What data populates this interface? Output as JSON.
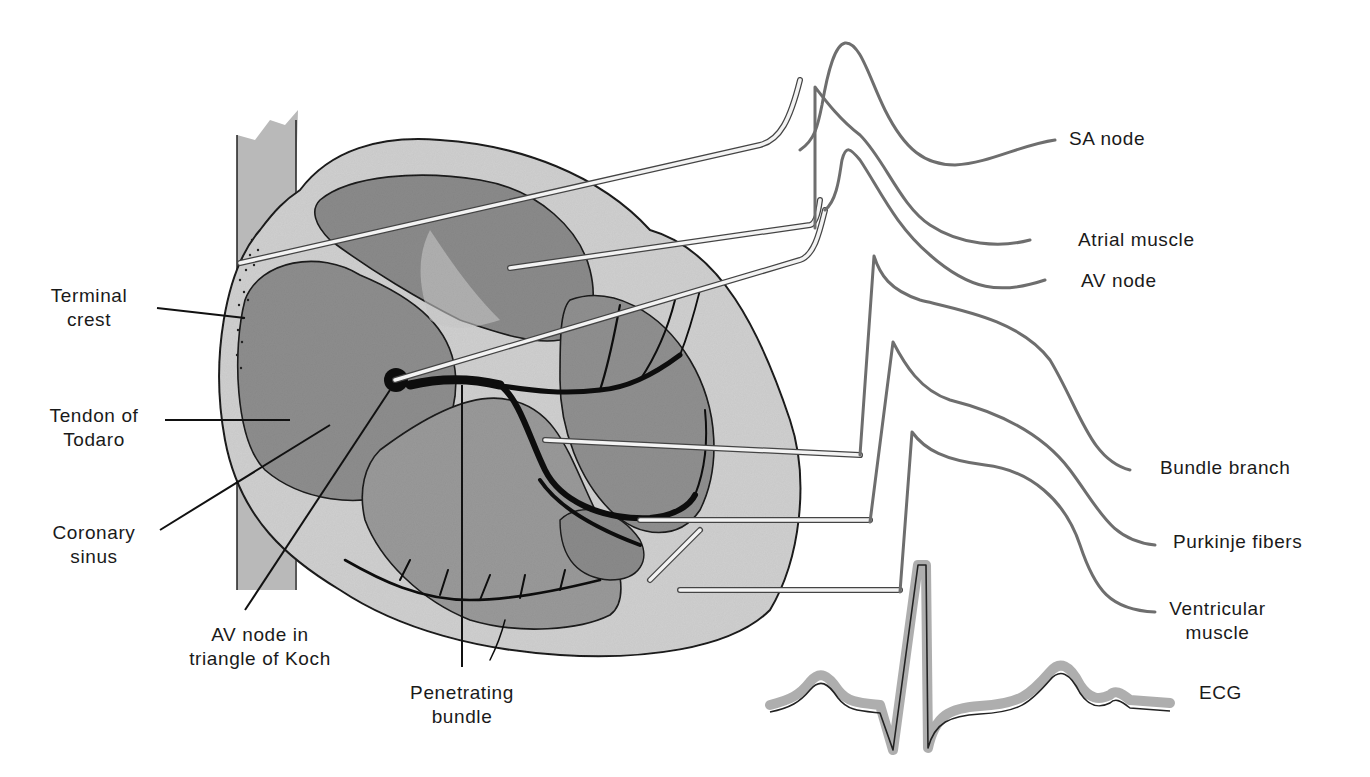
{
  "figure": {
    "colors": {
      "background": "#ffffff",
      "heart_wall": "#c9c9c9",
      "chamber": "#8e8e8e",
      "conduction_tissue": "#111111",
      "trace": "#7a7a7a",
      "probe": "#e8e8e8"
    }
  },
  "left_labels": {
    "terminal_crest": {
      "line1": "Terminal",
      "line2": "crest"
    },
    "tendon_of_todaro": {
      "line1": "Tendon of",
      "line2": "Todaro"
    },
    "coronary_sinus": {
      "line1": "Coronary",
      "line2": "sinus"
    },
    "av_node_koch": {
      "line1": "AV node in",
      "line2": "triangle of Koch"
    },
    "penetrating_bundle": {
      "line1": "Penetrating",
      "line2": "bundle"
    }
  },
  "trace_labels": {
    "sa_node": "SA node",
    "atrial_muscle": "Atrial muscle",
    "av_node": "AV node",
    "bundle_branch": "Bundle branch",
    "purkinje": "Purkinje fibers",
    "ventricular": {
      "line1": "Ventricular",
      "line2": "muscle"
    },
    "ecg": "ECG"
  }
}
